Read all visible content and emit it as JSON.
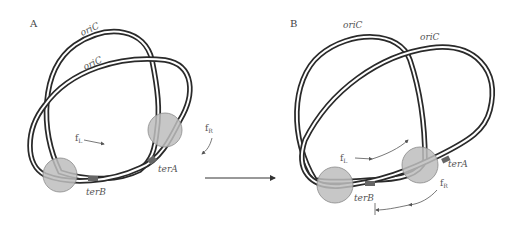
{
  "figure": {
    "panels": [
      {
        "id": "A",
        "label": "A",
        "labels": {
          "ori_top": "oriC",
          "ori_inner": "oriC",
          "ter_a": "terA",
          "ter_b": "terB",
          "fork_left": "f",
          "fork_left_sub": "L",
          "fork_right": "f",
          "fork_right_sub": "R"
        }
      },
      {
        "id": "B",
        "label": "B",
        "labels": {
          "ori_top": "oriC",
          "ori_inner": "oriC",
          "ter_a": "terA",
          "ter_b": "terB",
          "fork_left": "f",
          "fork_left_sub": "L",
          "fork_right": "f",
          "fork_right_sub": "R"
        }
      }
    ],
    "colors": {
      "strand": "#2a2a2a",
      "replisome": "#bdbdbd",
      "replisome_edge": "#8a8a8a",
      "text": "#555555"
    }
  }
}
